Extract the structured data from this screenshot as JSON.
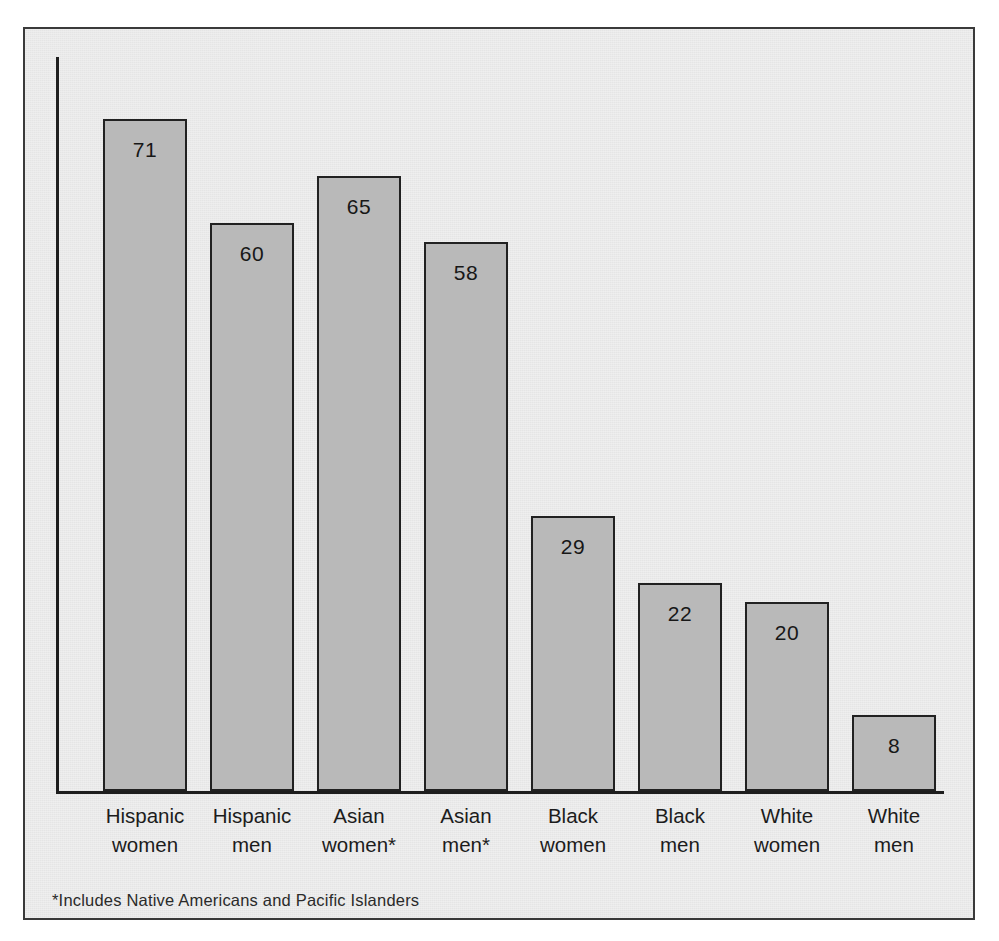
{
  "chart_data": {
    "type": "bar",
    "title": "",
    "subtitle": "",
    "xlabel": "",
    "ylabel": "",
    "ylim": [
      0,
      75
    ],
    "grid": false,
    "legend": false,
    "axis_style": "left-spine-and-baseline-only",
    "value_labels_inside_bars": true,
    "categories": [
      "Hispanic women",
      "Hispanic men",
      "Asian women*",
      "Asian men*",
      "Black women",
      "Black men",
      "White women",
      "White men"
    ],
    "category_lines": [
      [
        "Hispanic",
        "women"
      ],
      [
        "Hispanic",
        "men"
      ],
      [
        "Asian",
        "women*"
      ],
      [
        "Asian",
        "men*"
      ],
      [
        "Black",
        "women"
      ],
      [
        "Black",
        "men"
      ],
      [
        "White",
        "women"
      ],
      [
        "White",
        "men"
      ]
    ],
    "values": [
      71,
      60,
      65,
      58,
      29,
      22,
      20,
      8
    ],
    "value_label_texts": [
      "71",
      "60",
      "65",
      "58",
      "29",
      "22",
      "20",
      "8"
    ],
    "annotations": [
      "*Includes Native Americans and Pacific Islanders"
    ]
  },
  "footnote": "*Includes Native Americans and Pacific Islanders",
  "colors": {
    "page_background": "#ffffff",
    "panel_background": "#e5e5e5",
    "panel_border": "#3a3a3a",
    "axis": "#1e1e1e",
    "bar_fill": "#b9b9b9",
    "bar_outline": "#212121",
    "text": "#1c1c1c"
  }
}
